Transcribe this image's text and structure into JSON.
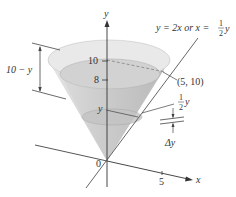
{
  "diagram": {
    "type": "cone-volume-diagram",
    "axes": {
      "y_label": "y",
      "x_label": "x",
      "origin_label": "0",
      "y_ticks": [
        "10",
        "8"
      ],
      "x_ticks": [
        "5"
      ]
    },
    "annotations": {
      "line_equation": "y = 2x or x = ",
      "line_equation_frac_num": "1",
      "line_equation_frac_den": "2",
      "line_equation_var": "y",
      "point_label": "(5, 10)",
      "slice_height_label": "y",
      "radius_frac_num": "1",
      "radius_frac_den": "2",
      "radius_var": "y",
      "thickness_label": "Δy",
      "distance_label": "10 − y"
    },
    "colors": {
      "line": "#444444",
      "cone_fill": "#d9d9d9",
      "cone_rim": "#e8e8e8",
      "water": "#c8c8c8",
      "text": "#333333"
    }
  }
}
